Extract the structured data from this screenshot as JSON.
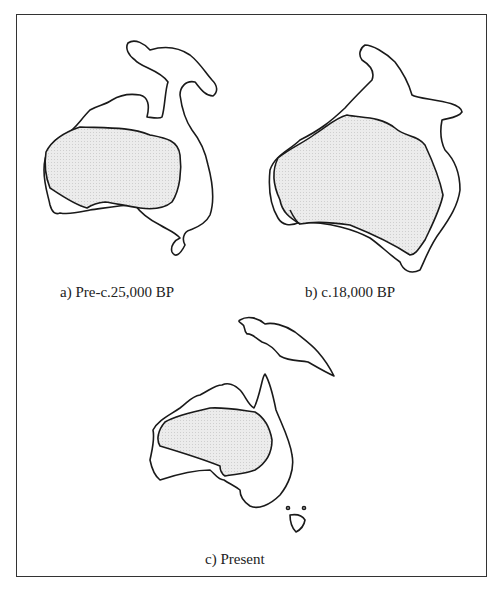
{
  "figure": {
    "panels": [
      {
        "id": "a",
        "caption": "a) Pre-c.25,000 BP"
      },
      {
        "id": "b",
        "caption": "b) c.18,000 BP"
      },
      {
        "id": "c",
        "caption": "c) Present"
      }
    ],
    "legend_meaning": {
      "shaded_area": "arid zone",
      "outline": "coastline / land extent"
    },
    "colors": {
      "outline": "#1a1a1a",
      "shading": "#e6e6e6",
      "frame": "#333333"
    }
  }
}
